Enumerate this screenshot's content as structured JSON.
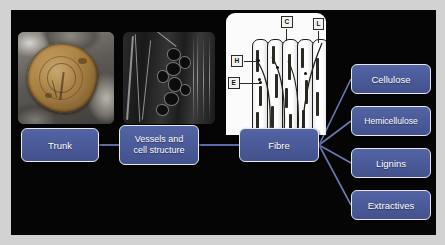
{
  "figure": {
    "type": "process-flow-diagram",
    "background_color": "#050505",
    "box_fill_color": "#4a5a98",
    "box_border_color": "#e8e8ee",
    "box_text_color": "#ffffff",
    "connector_color": "#5d6ba8"
  },
  "flow": {
    "stages": [
      {
        "id": "trunk",
        "label": "Trunk"
      },
      {
        "id": "vessels",
        "label": "Vessels and\ncell structure",
        "line1": "Vessels and",
        "line2": "cell structure"
      },
      {
        "id": "fibre",
        "label": "Fibre"
      }
    ],
    "components": [
      {
        "id": "cellulose",
        "label": "Cellulose"
      },
      {
        "id": "hemicellulose",
        "label": "Hemicellulose"
      },
      {
        "id": "lignins",
        "label": "Lignins"
      },
      {
        "id": "extractives",
        "label": "Extractives"
      }
    ]
  },
  "images": {
    "trunk_photo": {
      "name": "cut-log-cross-section-photo",
      "description": "Photograph of a sawn log end showing tan-brown heartwood disc on grey background"
    },
    "cell_structure_photo": {
      "name": "wood-cell-structure-micrograph",
      "description": "Greyscale scanning electron micrograph of wood vessels and cell walls"
    }
  },
  "fibre_diagram": {
    "name": "fibre-cell-wall-schematic",
    "panel_background": "#fbfbfb",
    "tube_count": 5,
    "callouts": [
      {
        "key": "C",
        "meaning": "Cellulose",
        "position": "top-left"
      },
      {
        "key": "L",
        "meaning": "Lignins",
        "position": "top-right"
      },
      {
        "key": "H",
        "meaning": "Hemicellulose",
        "position": "left-upper"
      },
      {
        "key": "E",
        "meaning": "Extractives",
        "position": "left-lower"
      }
    ]
  }
}
